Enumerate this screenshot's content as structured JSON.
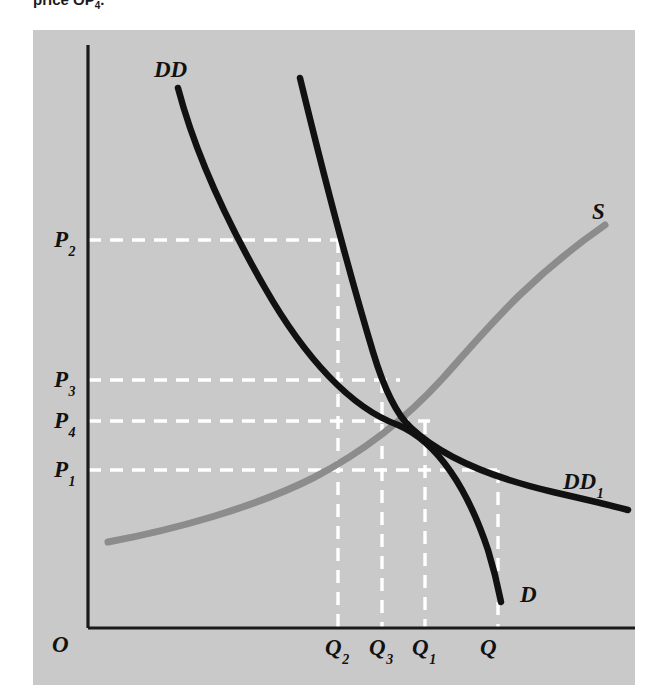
{
  "caption": {
    "text_before": "price OP",
    "text_sub": "4",
    "text_after": "."
  },
  "figure": {
    "background_color": "#c9c9c9",
    "axis_color": "#1a1a1a",
    "demand_curve_color": "#111111",
    "supply_curve_color": "#8a8a8a",
    "dashed_guide_color": "#ffffff",
    "origin_label": "O",
    "price_axis_labels": [
      {
        "name": "P2",
        "base": "P",
        "sub": "2",
        "x": 54,
        "y": 228,
        "value_y": 240
      },
      {
        "name": "P3",
        "base": "P",
        "sub": "3",
        "x": 54,
        "y": 368,
        "value_y": 380
      },
      {
        "name": "P4",
        "base": "P",
        "sub": "4",
        "x": 54,
        "y": 409,
        "value_y": 421
      },
      {
        "name": "P1",
        "base": "P",
        "sub": "1",
        "x": 54,
        "y": 458,
        "value_y": 470
      }
    ],
    "quantity_axis_labels": [
      {
        "name": "Q2",
        "base": "Q",
        "sub": "2",
        "x": 325,
        "y": 636,
        "value_x": 338
      },
      {
        "name": "Q3",
        "base": "Q",
        "sub": "3",
        "x": 369,
        "y": 636,
        "value_x": 382
      },
      {
        "name": "Q1",
        "base": "Q",
        "sub": "1",
        "x": 412,
        "y": 636,
        "value_x": 425
      },
      {
        "name": "Q",
        "base": "Q",
        "sub": "",
        "x": 480,
        "y": 636,
        "value_x": 498
      }
    ],
    "curve_labels": [
      {
        "name": "DD",
        "base": "DD",
        "sub": "",
        "x": 154,
        "y": 58
      },
      {
        "name": "S",
        "base": "S",
        "sub": "",
        "x": 592,
        "y": 200
      },
      {
        "name": "DD1",
        "base": "DD",
        "sub": "1",
        "x": 563,
        "y": 470
      },
      {
        "name": "D",
        "base": "D",
        "sub": "",
        "x": 520,
        "y": 583
      }
    ],
    "origin": {
      "x": 52,
      "y": 636
    }
  },
  "chart_data": {
    "type": "line",
    "title": "",
    "xlabel": "Quantity",
    "ylabel": "Price",
    "grid": false,
    "legend_position": "inline-curve-labels",
    "axis_origin_label": "O",
    "x_tick_labels": [
      "Q2",
      "Q3",
      "Q1",
      "Q"
    ],
    "y_tick_labels": [
      "P2",
      "P3",
      "P4",
      "P1"
    ],
    "series": [
      {
        "name": "DD",
        "label": "DD",
        "type": "demand",
        "color": "#111111",
        "points": [
          [
            178,
            88
          ],
          [
            205,
            150
          ],
          [
            238,
            215
          ],
          [
            275,
            285
          ],
          [
            312,
            345
          ],
          [
            350,
            395
          ],
          [
            398,
            425
          ],
          [
            430,
            470
          ],
          [
            460,
            530
          ],
          [
            486,
            580
          ],
          [
            498,
            600
          ]
        ]
      },
      {
        "name": "DD1",
        "label": "DD1",
        "type": "demand-shifted",
        "color": "#111111",
        "points": [
          [
            300,
            78
          ],
          [
            330,
            150
          ],
          [
            355,
            230
          ],
          [
            375,
            310
          ],
          [
            392,
            390
          ],
          [
            398,
            425
          ],
          [
            430,
            452
          ],
          [
            480,
            478
          ],
          [
            540,
            498
          ],
          [
            590,
            511
          ],
          [
            625,
            518
          ]
        ]
      },
      {
        "name": "S",
        "label": "S",
        "type": "supply",
        "color": "#8a8a8a",
        "points": [
          [
            108,
            542
          ],
          [
            160,
            527
          ],
          [
            220,
            505
          ],
          [
            280,
            478
          ],
          [
            340,
            448
          ],
          [
            398,
            425
          ],
          [
            450,
            395
          ],
          [
            500,
            355
          ],
          [
            545,
            305
          ],
          [
            580,
            260
          ],
          [
            605,
            225
          ]
        ]
      }
    ],
    "equilibrium_points": [
      {
        "label": "original equilibrium",
        "x_label": "Q3",
        "y_label": "P4",
        "x": 398,
        "y": 425
      }
    ],
    "guide_lines": {
      "horizontal": [
        {
          "y_label": "P2",
          "y": 240,
          "x_from": 88,
          "x_to": 340
        },
        {
          "y_label": "P3",
          "y": 380,
          "x_from": 88,
          "x_to": 400
        },
        {
          "y_label": "P4",
          "y": 421,
          "x_from": 88,
          "x_to": 430
        },
        {
          "y_label": "P1",
          "y": 470,
          "x_from": 88,
          "x_to": 500
        }
      ],
      "vertical": [
        {
          "x_label": "Q2",
          "x": 338,
          "y_from": 240,
          "y_to": 628
        },
        {
          "x_label": "Q3",
          "x": 382,
          "y_from": 380,
          "y_to": 628
        },
        {
          "x_label": "Q1",
          "x": 425,
          "y_from": 421,
          "y_to": 628
        },
        {
          "x_label": "Q",
          "x": 498,
          "y_from": 470,
          "y_to": 628
        }
      ]
    },
    "axis_ranges": {
      "x": [
        88,
        635
      ],
      "y": [
        45,
        628
      ]
    }
  },
  "bleed_text": [
    {
      "text": "Cases of hard work and toil",
      "x": 215,
      "y": 172
    },
    {
      "text": "nearly all were",
      "x": 240,
      "y": 258
    },
    {
      "text": "Lines Trade.",
      "x": 205,
      "y": 305
    },
    {
      "text": "the many in quantity and they",
      "x": 165,
      "y": 358
    },
    {
      "text": "and a farther the commodity",
      "x": 175,
      "y": 378
    },
    {
      "text": "that we defined an equation which",
      "x": 150,
      "y": 398
    },
    {
      "text": "eos is what two in all the price",
      "x": 162,
      "y": 418
    },
    {
      "text": "differentials are and quantity",
      "x": 188,
      "y": 450
    },
    {
      "text": "but is a made in an end-unvert radi",
      "x": 130,
      "y": 495
    },
    {
      "text": "hosting that they are not very compare",
      "x": 140,
      "y": 525
    },
    {
      "text": "the the treatment of each, other",
      "x": 168,
      "y": 552
    },
    {
      "text": "of the set no longer",
      "x": 185,
      "y": 578
    }
  ]
}
